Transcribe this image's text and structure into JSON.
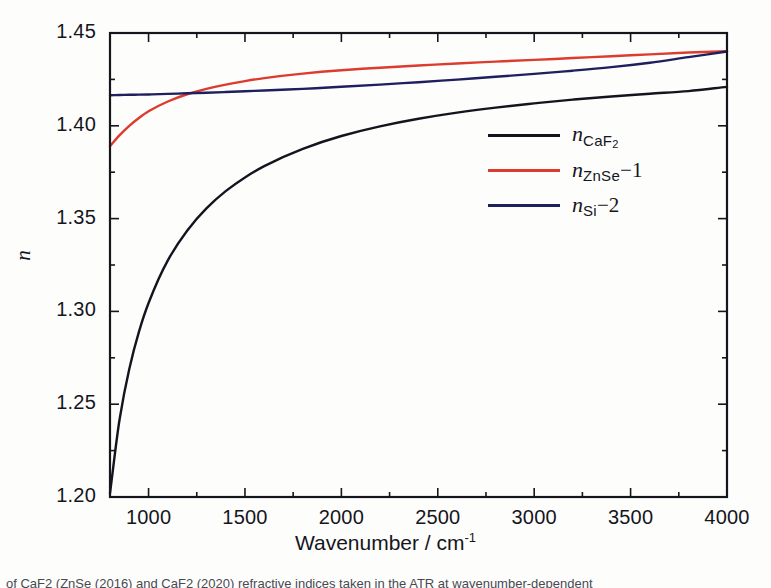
{
  "figure": {
    "background_color": "#fdfdfc",
    "frame_color": "#15151c"
  },
  "axes": {
    "y_title": "n",
    "x_title_main": "Wavenumber / cm",
    "x_title_exponent": "-1",
    "y_tick_labels": [
      "1.45",
      "1.40",
      "1.35",
      "1.30",
      "1.25",
      "1.20"
    ],
    "y_tick_values": [
      1.45,
      1.4,
      1.35,
      1.3,
      1.25,
      1.2
    ],
    "x_tick_labels": [
      "1000",
      "1500",
      "2000",
      "2500",
      "3000",
      "3500",
      "4000"
    ],
    "x_tick_values": [
      1000,
      1500,
      2000,
      2500,
      3000,
      3500,
      4000
    ]
  },
  "legend": {
    "position": "inside-right",
    "entries": [
      {
        "label": "n_CaF2",
        "symbol": "n",
        "subscript": "CaF",
        "subscript_number": "2",
        "offset": "",
        "color": "#14141f"
      },
      {
        "label": "n_ZnSe-1",
        "symbol": "n",
        "subscript": "ZnSe",
        "subscript_number": "",
        "offset": "−1",
        "color": "#dc3b2e"
      },
      {
        "label": "n_Si-2",
        "symbol": "n",
        "subscript": "Si",
        "subscript_number": "",
        "offset": "−2",
        "color": "#1d1f5e"
      }
    ]
  },
  "caption": {
    "text": "of CaF2 (ZnSe (2016) and CaF2 (2020) refractive indices taken in the ATR at wavenumber-dependent"
  },
  "chart_data": {
    "type": "line",
    "title": "",
    "xlabel": "Wavenumber / cm-1",
    "ylabel": "n",
    "xlim": [
      800,
      4000
    ],
    "ylim": [
      1.2,
      1.45
    ],
    "grid": false,
    "legend_position": "inside-right",
    "x_major_tick_step": 500,
    "x_minor_tick_step": 250,
    "y_major_tick_step": 0.05,
    "y_minor_tick_step": 0.025,
    "x": [
      800,
      850,
      900,
      950,
      1000,
      1100,
      1200,
      1300,
      1400,
      1500,
      1600,
      1800,
      2000,
      2200,
      2400,
      2600,
      2800,
      3000,
      3200,
      3400,
      3600,
      3800,
      4000
    ],
    "series": [
      {
        "name": "n_CaF2",
        "color": "#14141f",
        "values": [
          1.202,
          1.242,
          1.269,
          1.289,
          1.3045,
          1.3275,
          1.3435,
          1.3555,
          1.3648,
          1.3722,
          1.3783,
          1.3876,
          1.3945,
          1.3997,
          1.4038,
          1.4071,
          1.4098,
          1.4121,
          1.4141,
          1.4158,
          1.4173,
          1.4187,
          1.421
        ]
      },
      {
        "name": "n_ZnSe-1",
        "color": "#dc3b2e",
        "values": [
          1.389,
          1.395,
          1.4,
          1.4042,
          1.4078,
          1.4131,
          1.417,
          1.4199,
          1.4222,
          1.4241,
          1.4257,
          1.4281,
          1.4299,
          1.4313,
          1.4325,
          1.4336,
          1.4346,
          1.4355,
          1.4365,
          1.4375,
          1.4385,
          1.4395,
          1.4402
        ]
      },
      {
        "name": "n_Si-2",
        "color": "#1d1f5e",
        "values": [
          1.4165,
          1.4166,
          1.4167,
          1.4168,
          1.4169,
          1.4172,
          1.4175,
          1.4178,
          1.4182,
          1.4186,
          1.419,
          1.4199,
          1.421,
          1.4222,
          1.4235,
          1.4249,
          1.4264,
          1.428,
          1.4297,
          1.4316,
          1.434,
          1.437,
          1.44
        ]
      }
    ]
  }
}
